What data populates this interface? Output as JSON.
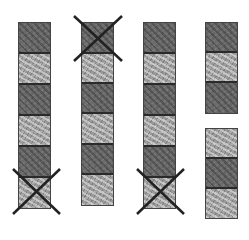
{
  "diagram": {
    "columns": [
      {
        "id": 1,
        "blocks": [
          "dark",
          "light",
          "dark",
          "light",
          "dark",
          "light"
        ],
        "crossed_blocks": [
          6
        ]
      },
      {
        "id": 2,
        "blocks": [
          "dark",
          "light",
          "dark",
          "light",
          "dark",
          "light"
        ],
        "crossed_blocks": [
          1
        ]
      },
      {
        "id": 3,
        "blocks": [
          "dark",
          "light",
          "dark",
          "light",
          "dark",
          "light"
        ],
        "crossed_blocks": [
          6
        ]
      },
      {
        "id": 4,
        "groups": [
          {
            "blocks": [
              "dark",
              "light",
              "dark"
            ]
          },
          {
            "blocks": [
              "light",
              "dark",
              "light"
            ]
          }
        ],
        "crossed_blocks": []
      }
    ],
    "colors": {
      "border": "#2a2a2a",
      "cross": "#222222",
      "dark_block": "#6b6b6b",
      "light_block": "#9a9a9a"
    }
  }
}
